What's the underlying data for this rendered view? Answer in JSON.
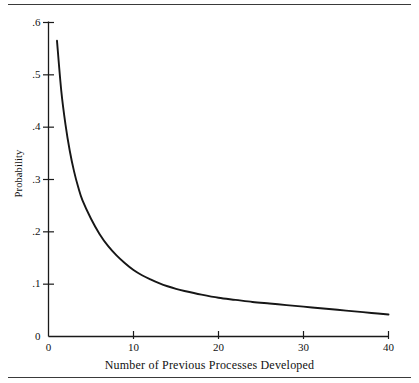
{
  "figure": {
    "background_color": "#ffffff",
    "line_color": "#161616",
    "axis_color": "#1a1a1a",
    "rule_color": "#3a3a3a",
    "top_rule": "horizontal-rule",
    "bottom_rule": "horizontal-rule"
  },
  "chart_data": {
    "type": "line",
    "title": "",
    "xlabel": "Number of Previous Processes Developed",
    "ylabel": "Probability",
    "xlim": [
      0,
      40
    ],
    "ylim": [
      0,
      0.6
    ],
    "grid": false,
    "legend": null,
    "x_ticks": [
      0,
      10,
      20,
      30,
      40
    ],
    "x_tick_labels": [
      "0",
      "10",
      "20",
      "30",
      "40"
    ],
    "y_ticks": [
      0,
      0.1,
      0.2,
      0.3,
      0.4,
      0.5,
      0.6
    ],
    "y_tick_labels": [
      "0",
      ".1",
      ".2",
      ".3",
      ".4",
      ".5",
      ".6"
    ],
    "series": [
      {
        "name": "Probability",
        "color": "#161616",
        "x": [
          1,
          1.5,
          2,
          2.5,
          3,
          3.5,
          4,
          5,
          6,
          7,
          8,
          9,
          10,
          11,
          12,
          13,
          14,
          15,
          16,
          18,
          20,
          22,
          24,
          26,
          28,
          30,
          32,
          34,
          36,
          38,
          40
        ],
        "values": [
          0.565,
          0.47,
          0.405,
          0.355,
          0.316,
          0.285,
          0.26,
          0.225,
          0.196,
          0.173,
          0.155,
          0.14,
          0.127,
          0.117,
          0.109,
          0.102,
          0.096,
          0.091,
          0.087,
          0.08,
          0.074,
          0.07,
          0.066,
          0.063,
          0.06,
          0.057,
          0.054,
          0.051,
          0.048,
          0.045,
          0.042
        ]
      }
    ]
  }
}
